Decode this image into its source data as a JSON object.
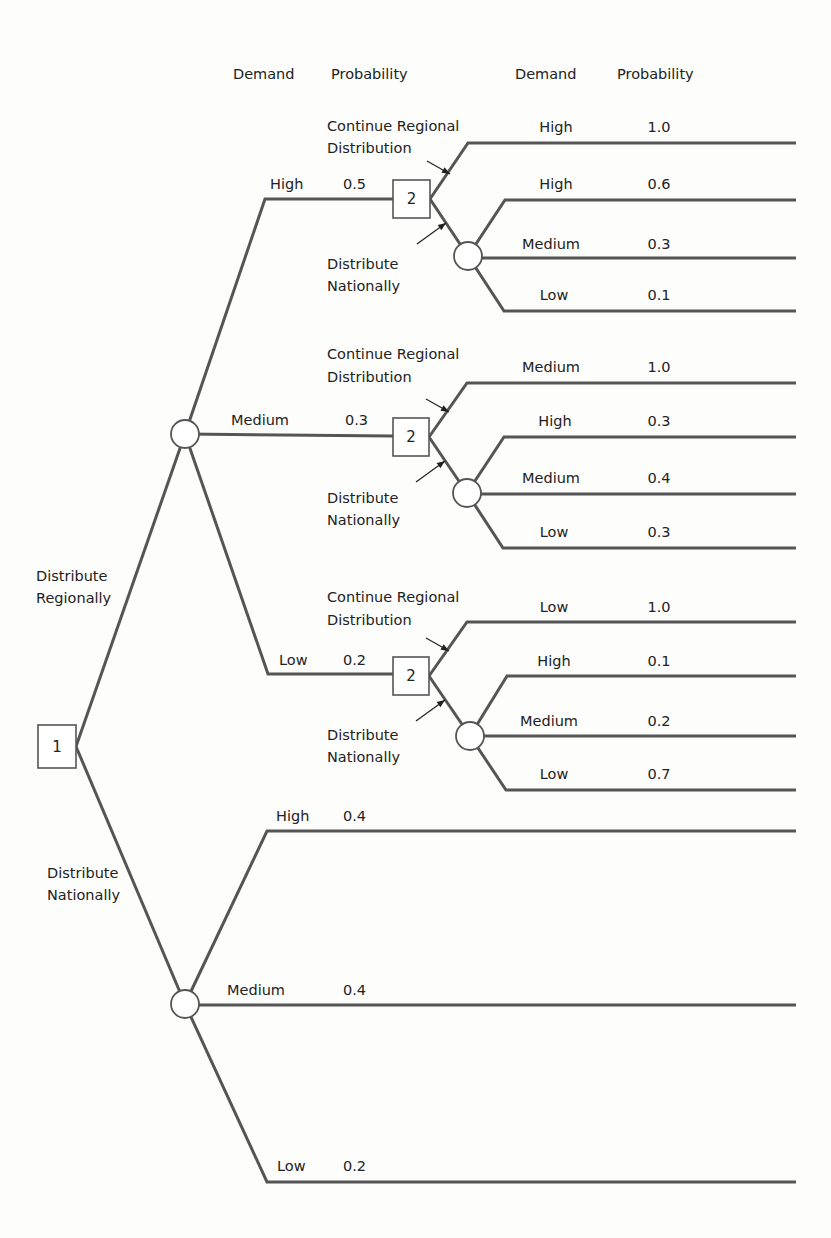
{
  "header": {
    "col1_demand": "Demand",
    "col1_probability": "Probability",
    "col2_demand": "Demand",
    "col2_probability": "Probability"
  },
  "decision_nodes": [
    {
      "id": "1",
      "label": "1",
      "x": 38,
      "y": 725,
      "w": 38,
      "h": 43
    },
    {
      "id": "2a",
      "label": "2",
      "x": 393,
      "y": 180,
      "w": 37,
      "h": 38
    },
    {
      "id": "2b",
      "label": "2",
      "x": 393,
      "y": 418,
      "w": 36,
      "h": 38
    },
    {
      "id": "2c",
      "label": "2",
      "x": 393,
      "y": 657,
      "w": 36,
      "h": 38
    }
  ],
  "chance_nodes": [
    {
      "id": "reg",
      "cx": 185,
      "cy": 434,
      "r": 14
    },
    {
      "id": "nat",
      "cx": 185,
      "cy": 1004,
      "r": 14
    },
    {
      "id": "c2a",
      "cx": 468,
      "cy": 256,
      "r": 14
    },
    {
      "id": "c2b",
      "cx": 467,
      "cy": 493,
      "r": 14
    },
    {
      "id": "c2c",
      "cx": 470,
      "cy": 736,
      "r": 14
    }
  ],
  "first_decision": {
    "regional_label": [
      "Distribute",
      "Regionally"
    ],
    "national_label": [
      "Distribute",
      "Nationally"
    ]
  },
  "regional_branches": [
    {
      "demand": "High",
      "probability": "0.5",
      "line_y": 199,
      "second_decision": {
        "continue_label": [
          "Continue Regional",
          "Distribution"
        ],
        "national_label": [
          "Distribute",
          "Nationally"
        ],
        "continue_outcome": {
          "demand": "High",
          "probability": "1.0",
          "line_y": 143
        },
        "national_outcomes": [
          {
            "demand": "High",
            "probability": "0.6",
            "line_y": 200
          },
          {
            "demand": "Medium",
            "probability": "0.3",
            "line_y": 258
          },
          {
            "demand": "Low",
            "probability": "0.1",
            "line_y": 311
          }
        ]
      }
    },
    {
      "demand": "Medium",
      "probability": "0.3",
      "line_y": 436,
      "second_decision": {
        "continue_label": [
          "Continue Regional",
          "Distribution"
        ],
        "national_label": [
          "Distribute",
          "Nationally"
        ],
        "continue_outcome": {
          "demand": "Medium",
          "probability": "1.0",
          "line_y": 383
        },
        "national_outcomes": [
          {
            "demand": "High",
            "probability": "0.3",
            "line_y": 437
          },
          {
            "demand": "Medium",
            "probability": "0.4",
            "line_y": 494
          },
          {
            "demand": "Low",
            "probability": "0.3",
            "line_y": 548
          }
        ]
      }
    },
    {
      "demand": "Low",
      "probability": "0.2",
      "line_y": 674,
      "second_decision": {
        "continue_label": [
          "Continue Regional",
          "Distribution"
        ],
        "national_label": [
          "Distribute",
          "Nationally"
        ],
        "continue_outcome": {
          "demand": "Low",
          "probability": "1.0",
          "line_y": 622
        },
        "national_outcomes": [
          {
            "demand": "High",
            "probability": "0.1",
            "line_y": 676
          },
          {
            "demand": "Medium",
            "probability": "0.2",
            "line_y": 736
          },
          {
            "demand": "Low",
            "probability": "0.7",
            "line_y": 790
          }
        ]
      }
    }
  ],
  "national_branches": [
    {
      "demand": "High",
      "probability": "0.4",
      "line_y": 831
    },
    {
      "demand": "Medium",
      "probability": "0.4",
      "line_y": 1005
    },
    {
      "demand": "Low",
      "probability": "0.2",
      "line_y": 1182
    }
  ],
  "colors": {
    "line": "#555555",
    "text": "#222222",
    "background": "#fdfdfc"
  }
}
